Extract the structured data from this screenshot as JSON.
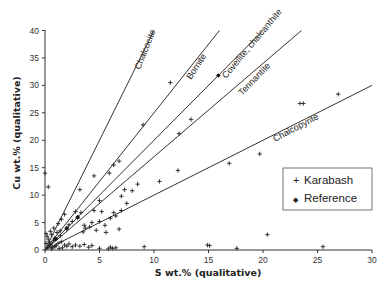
{
  "chart_data": {
    "type": "scatter",
    "title": "",
    "xlabel": "S wt.% (qualitative)",
    "ylabel": "Cu wt.% (qualitative)",
    "xlim": [
      0,
      30
    ],
    "ylim": [
      0,
      40
    ],
    "xticks": [
      0,
      5,
      10,
      15,
      20,
      25,
      30
    ],
    "yticks": [
      0,
      5,
      10,
      15,
      20,
      25,
      30,
      35,
      40
    ],
    "grid": false,
    "legend_position": "lower right (inside)",
    "reference_lines": [
      {
        "name": "Chalcocite",
        "slope": 4.0
      },
      {
        "name": "Bornite",
        "slope": 2.5
      },
      {
        "name": "Covellite, chalcanthite",
        "slope": 2.0
      },
      {
        "name": "Tennantite",
        "slope": 1.7
      },
      {
        "name": "Chalcopyrite",
        "slope": 1.0
      }
    ],
    "series": [
      {
        "name": "Karabash",
        "marker": "+",
        "points": [
          [
            0.0,
            14.0
          ],
          [
            0.3,
            11.5
          ],
          [
            0.1,
            3.0
          ],
          [
            0.2,
            2.5
          ],
          [
            0.3,
            2.0
          ],
          [
            0.4,
            1.5
          ],
          [
            0.5,
            1.0
          ],
          [
            0.6,
            2.8
          ],
          [
            0.7,
            0.5
          ],
          [
            0.8,
            1.8
          ],
          [
            0.9,
            2.2
          ],
          [
            1.0,
            0.8
          ],
          [
            1.1,
            3.2
          ],
          [
            1.2,
            1.2
          ],
          [
            1.3,
            0.3
          ],
          [
            1.4,
            2.6
          ],
          [
            1.5,
            1.5
          ],
          [
            0.2,
            0.4
          ],
          [
            0.4,
            0.8
          ],
          [
            0.1,
            1.2
          ],
          [
            0.6,
            0.2
          ],
          [
            0.9,
            0.6
          ],
          [
            1.6,
            0.4
          ],
          [
            1.8,
            0.9
          ],
          [
            2.0,
            0.7
          ],
          [
            2.2,
            1.1
          ],
          [
            2.5,
            0.6
          ],
          [
            2.8,
            0.9
          ],
          [
            3.2,
            0.7
          ],
          [
            3.6,
            1.0
          ],
          [
            4.0,
            0.5
          ],
          [
            4.3,
            0.8
          ],
          [
            5.0,
            0.3
          ],
          [
            5.8,
            0.2
          ],
          [
            6.0,
            0.5
          ],
          [
            6.2,
            0.3
          ],
          [
            6.5,
            0.4
          ],
          [
            9.1,
            0.6
          ],
          [
            14.9,
            0.9
          ],
          [
            15.1,
            0.8
          ],
          [
            17.6,
            0.3
          ],
          [
            20.4,
            2.8
          ],
          [
            25.5,
            0.6
          ],
          [
            1.2,
            4.8
          ],
          [
            1.5,
            5.6
          ],
          [
            1.8,
            6.5
          ],
          [
            2.0,
            3.8
          ],
          [
            2.2,
            4.6
          ],
          [
            2.5,
            5.2
          ],
          [
            2.8,
            7.0
          ],
          [
            3.0,
            5.8
          ],
          [
            3.3,
            6.8
          ],
          [
            3.5,
            3.3
          ],
          [
            3.6,
            4.5
          ],
          [
            3.7,
            4.0
          ],
          [
            4.1,
            4.2
          ],
          [
            4.3,
            5.0
          ],
          [
            4.5,
            7.2
          ],
          [
            4.7,
            3.6
          ],
          [
            5.0,
            5.2
          ],
          [
            5.2,
            7.0
          ],
          [
            5.5,
            4.5
          ],
          [
            5.6,
            3.2
          ],
          [
            6.0,
            5.8
          ],
          [
            6.3,
            6.8
          ],
          [
            6.5,
            6.2
          ],
          [
            6.8,
            3.8
          ],
          [
            7.0,
            7.2
          ],
          [
            7.5,
            8.5
          ],
          [
            8.0,
            10.8
          ],
          [
            8.5,
            12.0
          ],
          [
            6.3,
            15.5
          ],
          [
            6.8,
            16.2
          ],
          [
            5.9,
            14.0
          ],
          [
            7.3,
            11.0
          ],
          [
            7.0,
            9.8
          ],
          [
            4.5,
            13.5
          ],
          [
            5.0,
            9.0
          ],
          [
            3.2,
            11.0
          ],
          [
            9.0,
            22.8
          ],
          [
            11.5,
            30.5
          ],
          [
            12.2,
            14.5
          ],
          [
            10.5,
            12.5
          ],
          [
            12.3,
            21.2
          ],
          [
            13.4,
            23.8
          ],
          [
            16.9,
            15.8
          ],
          [
            19.7,
            17.5
          ],
          [
            23.4,
            26.7
          ],
          [
            23.7,
            26.7
          ],
          [
            26.9,
            28.4
          ],
          [
            0.8,
            4.0
          ],
          [
            1.4,
            3.5
          ],
          [
            0.5,
            3.4
          ]
        ]
      },
      {
        "name": "Reference",
        "marker": "diamond",
        "points": [
          [
            15.9,
            31.8
          ],
          [
            2.0,
            4.0
          ],
          [
            3.0,
            6.0
          ],
          [
            1.0,
            2.0
          ]
        ]
      }
    ]
  },
  "legend": {
    "items": [
      {
        "label": "Karabash",
        "symbol": "+"
      },
      {
        "label": "Reference",
        "symbol": "◆"
      }
    ]
  },
  "axes": {
    "x_title": "S wt.% (qualitative)",
    "y_title": "Cu wt.% (qualitative)"
  },
  "line_labels": {
    "chalcocite": "Chalcocite",
    "bornite": "Bornite",
    "covellite": "Covellite, chalcanthite",
    "tennantite": "Tennantite",
    "chalcopyrite": "Chalcopyrite"
  }
}
